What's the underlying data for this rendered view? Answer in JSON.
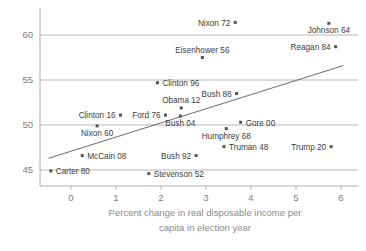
{
  "chart_data": {
    "type": "scatter",
    "title": "",
    "xlabel": "Percent change in real disposable income per capita in election year",
    "xlabel_line1": "Percent change in real disposable income per",
    "xlabel_line2": "capita in election year",
    "ylabel": "",
    "xlim": [
      -0.85,
      6.3
    ],
    "ylim": [
      43.6,
      61.9
    ],
    "xticks": [
      0,
      1,
      2,
      3,
      4,
      5,
      6
    ],
    "xtick_labels": [
      "0",
      "1",
      "2",
      "3",
      "4",
      "5",
      "6"
    ],
    "yticks": [
      45,
      50,
      55,
      60
    ],
    "ytick_labels": [
      "45",
      "50",
      "55",
      "60"
    ],
    "grid": true,
    "grid_axis": "y",
    "legend": "none",
    "marker_color": "#555555",
    "trend_color": "#5a5a5a",
    "grid_color": "#9a9a9a",
    "trendline": {
      "label": "regression-line",
      "x0": -0.5,
      "y0": 46.3,
      "x1": 6.05,
      "y1": 56.6
    },
    "points": [
      {
        "label": "Nixon 72",
        "x": 3.65,
        "y": 61.4,
        "label_side": "left"
      },
      {
        "label": "Johnson 64",
        "x": 5.73,
        "y": 61.3,
        "label_side": "below"
      },
      {
        "label": "Eisenhower 56",
        "x": 2.92,
        "y": 57.5,
        "label_side": "above"
      },
      {
        "label": "Reagan 84",
        "x": 5.88,
        "y": 58.7,
        "label_side": "left"
      },
      {
        "label": "Clinton 96",
        "x": 1.92,
        "y": 54.7,
        "label_side": "right"
      },
      {
        "label": "Bush 88",
        "x": 3.68,
        "y": 53.5,
        "label_side": "left"
      },
      {
        "label": "Obama 12",
        "x": 2.45,
        "y": 51.9,
        "label_side": "above"
      },
      {
        "label": "Clinton 16",
        "x": 1.1,
        "y": 51.1,
        "label_side": "left"
      },
      {
        "label": "Ford 76",
        "x": 2.1,
        "y": 51.1,
        "label_side": "left"
      },
      {
        "label": "Bush 04",
        "x": 2.43,
        "y": 51.0,
        "label_side": "below"
      },
      {
        "label": "Gore 00",
        "x": 3.77,
        "y": 50.3,
        "label_side": "right"
      },
      {
        "label": "Nixon 60",
        "x": 0.58,
        "y": 49.9,
        "label_side": "below"
      },
      {
        "label": "Humphrey 68",
        "x": 3.45,
        "y": 49.6,
        "label_side": "below"
      },
      {
        "label": "Truman 48",
        "x": 3.4,
        "y": 47.6,
        "label_side": "right"
      },
      {
        "label": "Trump 20",
        "x": 5.78,
        "y": 47.6,
        "label_side": "left"
      },
      {
        "label": "McCain 08",
        "x": 0.25,
        "y": 46.6,
        "label_side": "right"
      },
      {
        "label": "Bush 92",
        "x": 2.78,
        "y": 46.6,
        "label_side": "left"
      },
      {
        "label": "Carter 80",
        "x": -0.45,
        "y": 44.9,
        "label_side": "right"
      },
      {
        "label": "Stevenson 52",
        "x": 1.73,
        "y": 44.6,
        "label_side": "right"
      }
    ]
  }
}
